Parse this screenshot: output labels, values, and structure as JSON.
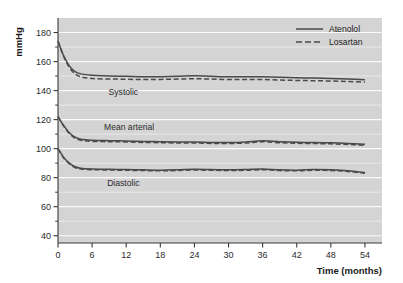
{
  "chart_data": {
    "type": "line",
    "title": "",
    "xlabel": "Time (months)",
    "ylabel": "mmHg",
    "xlim": [
      0,
      57
    ],
    "ylim": [
      35,
      190
    ],
    "xticks": [
      0,
      6,
      12,
      18,
      24,
      30,
      36,
      42,
      48,
      54
    ],
    "xticklabels": [
      "0",
      "6",
      "12",
      "18",
      "24",
      "30",
      "36",
      "42",
      "48",
      "54"
    ],
    "yticks": [
      40,
      60,
      80,
      100,
      120,
      140,
      160,
      180
    ],
    "yticklabels": [
      "40",
      "60",
      "80",
      "100",
      "120",
      "140",
      "160",
      "180"
    ],
    "yminorticks": [
      50,
      70,
      90,
      110,
      130,
      150,
      170
    ],
    "grid": "horizontal-major-and-minor-white-on-grey",
    "legend_position": "top-right-inside",
    "plot_background": "#d4d4d4",
    "gridline_color": "#f0f0f0",
    "line_color": "#4a4a4a",
    "x": [
      0,
      1,
      2,
      3,
      4,
      6,
      9,
      12,
      15,
      18,
      21,
      24,
      27,
      30,
      33,
      36,
      39,
      42,
      45,
      48,
      51,
      54
    ],
    "annotations": [
      {
        "text": "Systolic",
        "x": 11.5,
        "y": 137
      },
      {
        "text": "Mean arterial",
        "x": 12.5,
        "y": 113
      },
      {
        "text": "Diastolic",
        "x": 11.5,
        "y": 74
      }
    ],
    "series": [
      {
        "name": "Atenolol",
        "style": "solid",
        "measure": "Systolic",
        "values": [
          174,
          164,
          157,
          153,
          151.5,
          150.5,
          150,
          149.8,
          149.5,
          149.6,
          149.8,
          150.2,
          149.8,
          149.5,
          149.6,
          149.5,
          149.2,
          148.8,
          148.6,
          148.4,
          148.0,
          147.5
        ]
      },
      {
        "name": "Losartan",
        "style": "dashed",
        "measure": "Systolic",
        "values": [
          174,
          163.5,
          156,
          151.5,
          149.5,
          148.3,
          148.0,
          147.8,
          147.6,
          147.7,
          147.9,
          148.2,
          147.9,
          147.6,
          147.7,
          147.6,
          147.3,
          147.0,
          146.8,
          146.6,
          146.2,
          145.8
        ]
      },
      {
        "name": "Atenolol",
        "style": "solid",
        "measure": "Mean arterial",
        "values": [
          122,
          116,
          111,
          108,
          106.5,
          105.8,
          105.5,
          105.3,
          105.0,
          104.8,
          104.6,
          104.6,
          104.3,
          104.2,
          104.6,
          105.4,
          104.8,
          104.4,
          104.2,
          104.0,
          103.6,
          103.0
        ]
      },
      {
        "name": "Losartan",
        "style": "dashed",
        "measure": "Mean arterial",
        "values": [
          122,
          115.5,
          110.5,
          107.3,
          105.8,
          105.0,
          104.8,
          104.6,
          104.3,
          104.1,
          103.9,
          103.9,
          103.6,
          103.5,
          103.9,
          104.7,
          104.1,
          103.7,
          103.5,
          103.3,
          102.9,
          102.3
        ]
      },
      {
        "name": "Atenolol",
        "style": "solid",
        "measure": "Diastolic",
        "values": [
          100,
          94,
          90,
          87.5,
          86.5,
          86.0,
          85.8,
          85.6,
          85.4,
          85.2,
          85.4,
          85.8,
          85.6,
          85.4,
          85.6,
          86.0,
          85.4,
          85.2,
          85.6,
          85.4,
          84.8,
          83.5
        ]
      },
      {
        "name": "Losartan",
        "style": "dashed",
        "measure": "Diastolic",
        "values": [
          100,
          93.6,
          89.6,
          87.0,
          86.0,
          85.5,
          85.3,
          85.1,
          84.9,
          84.7,
          84.9,
          85.3,
          85.1,
          84.9,
          85.1,
          85.5,
          84.9,
          84.7,
          85.1,
          84.9,
          84.3,
          83.0
        ]
      }
    ],
    "legend": [
      {
        "label": "Atenolol",
        "style": "solid"
      },
      {
        "label": "Losartan",
        "style": "dashed"
      }
    ]
  }
}
